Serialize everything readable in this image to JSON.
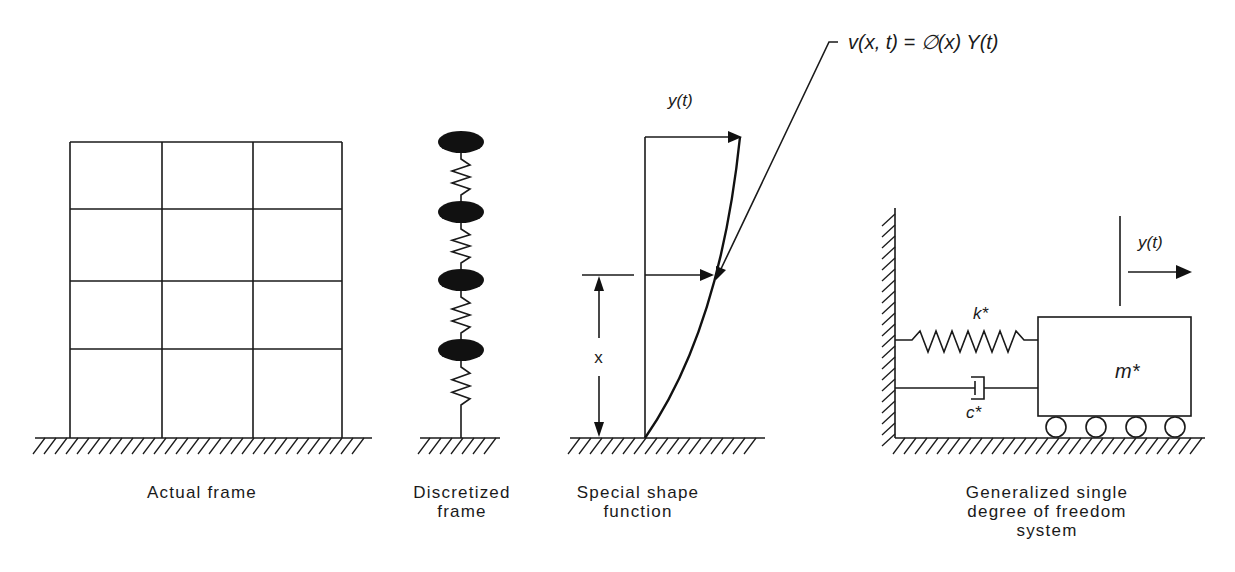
{
  "equation": {
    "text": "v(x,  t) = ∅(x) Y(t)",
    "x": 848,
    "y": 49
  },
  "panels": [
    {
      "id": "actual-frame",
      "caption": [
        "Actual frame"
      ],
      "caption_x": 202,
      "columns_x": [
        70,
        162,
        253,
        342
      ],
      "floors_y": [
        142,
        209,
        281,
        349
      ],
      "base_y": 438,
      "ground": {
        "x1": 35,
        "x2": 372,
        "y": 438
      }
    },
    {
      "id": "discretized-frame",
      "caption": [
        "Discretized",
        "frame"
      ],
      "caption_x": 462,
      "stem_x": 461,
      "masses_y": [
        142,
        212,
        280,
        350
      ],
      "mass_rx": 23,
      "mass_ry": 11,
      "ground": {
        "x1": 420,
        "x2": 500,
        "y": 438
      }
    },
    {
      "id": "special-shape-function",
      "caption": [
        "Special shape",
        "function"
      ],
      "caption_x": 638,
      "labels": {
        "top_displacement": "y(t)",
        "height": "x"
      },
      "ground": {
        "x1": 570,
        "x2": 765,
        "y": 438
      }
    },
    {
      "id": "generalized-sdof",
      "caption": [
        "Generalized single",
        "degree of freedom",
        "system"
      ],
      "caption_x": 1047,
      "labels": {
        "stiffness": "k*",
        "damping": "c*",
        "mass": "m*",
        "displacement": "y(t)"
      },
      "ground": {
        "x1": 895,
        "x2": 1205,
        "y": 438
      }
    }
  ],
  "caption_rows_y": [
    498,
    517,
    536
  ]
}
